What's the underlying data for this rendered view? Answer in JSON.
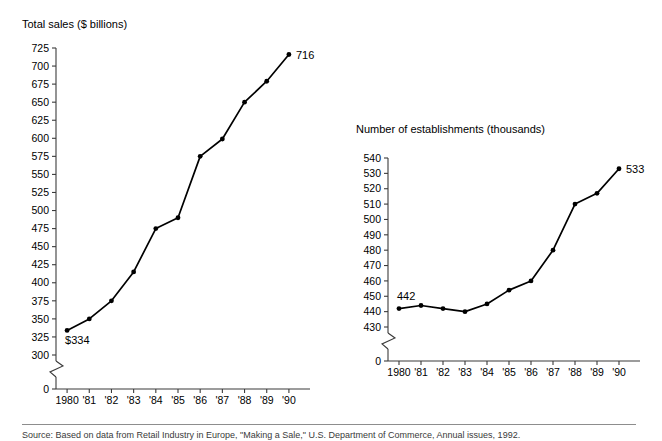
{
  "figure": {
    "background_color": "#ffffff",
    "ink_color": "#000000",
    "axis_color": "#3b3b3b",
    "footer_note": "Source: Based on data from Retail Industry in Europe, \"Making a Sale,\" U.S. Department of Commerce, Annual issues, 1992."
  },
  "chart_data": [
    {
      "type": "line",
      "title": "Total sales ($ billions)",
      "xlabel": "",
      "ylabel": "Total sales ($ billions)",
      "categories": [
        "1980",
        "'81",
        "'82",
        "'83",
        "'84",
        "'85",
        "'86",
        "'87",
        "'88",
        "'89",
        "'90"
      ],
      "values": [
        334,
        350,
        375,
        415,
        475,
        490,
        575,
        599,
        650,
        679,
        716
      ],
      "ylim": [
        300,
        725
      ],
      "ytick_step": 25,
      "yticks": [
        300,
        325,
        350,
        375,
        400,
        425,
        450,
        475,
        500,
        525,
        550,
        575,
        600,
        625,
        650,
        675,
        700,
        725
      ],
      "ytick_labels": [
        "300",
        "325",
        "350",
        "375",
        "400",
        "425",
        "450",
        "475",
        "500",
        "525",
        "550",
        "575",
        "600",
        "625",
        "650",
        "675",
        "700",
        "725"
      ],
      "axis_break": true,
      "zero_label": "0",
      "grid": false,
      "legend": "none",
      "markers": true,
      "annotations": [
        {
          "text": "$334",
          "category": "1980",
          "value": 334,
          "position": "below-right"
        },
        {
          "text": "716",
          "category": "'90",
          "value": 716,
          "position": "right"
        }
      ]
    },
    {
      "type": "line",
      "title": "Number of establishments (thousands)",
      "xlabel": "",
      "ylabel": "Number of establishments (thousands)",
      "categories": [
        "1980",
        "'81",
        "'82",
        "'83",
        "'84",
        "'85",
        "'86",
        "'87",
        "'88",
        "'89",
        "'90"
      ],
      "values": [
        442,
        444,
        442,
        440,
        445,
        454,
        460,
        480,
        510,
        517,
        533
      ],
      "ylim": [
        430,
        540
      ],
      "ytick_step": 10,
      "yticks": [
        430,
        440,
        450,
        460,
        470,
        480,
        490,
        500,
        510,
        520,
        530,
        540
      ],
      "ytick_labels": [
        "430",
        "440",
        "450",
        "460",
        "470",
        "480",
        "490",
        "500",
        "510",
        "520",
        "530",
        "540"
      ],
      "axis_break": true,
      "zero_label": "0",
      "grid": false,
      "legend": "none",
      "markers": true,
      "annotations": [
        {
          "text": "442",
          "category": "1980",
          "value": 442,
          "position": "above-right"
        },
        {
          "text": "533",
          "category": "'90",
          "value": 533,
          "position": "right"
        }
      ]
    }
  ]
}
